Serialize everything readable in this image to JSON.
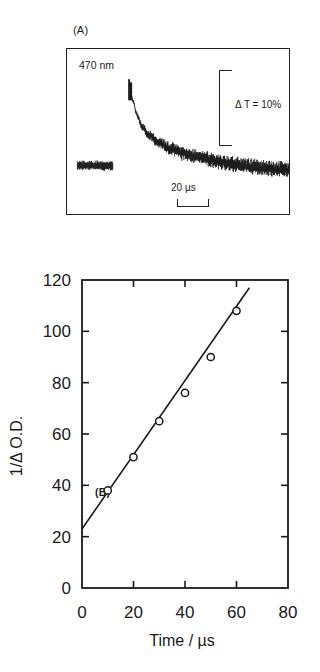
{
  "figure": {
    "panels": [
      {
        "tag": "(A)",
        "type": "oscilloscope-trace",
        "wavelength_label": "470 nm",
        "vertical_scale_label": "Δ T = 10%",
        "horizontal_scale_label": "20 µs"
      },
      {
        "tag": "(B)",
        "type": "scatter-with-fit"
      }
    ]
  },
  "chart_data": {
    "type": "scatter",
    "title": "",
    "xlabel": "Time  /   µs",
    "ylabel": "1/Δ O.D.",
    "xlim": [
      0,
      80
    ],
    "ylim": [
      0,
      120
    ],
    "xticks": [
      0,
      20,
      40,
      60,
      80
    ],
    "yticks": [
      0,
      20,
      40,
      60,
      80,
      100,
      120
    ],
    "xtick_labels": [
      "0",
      "20",
      "40",
      "60",
      "80"
    ],
    "ytick_labels": [
      "0",
      "20",
      "40",
      "60",
      "80",
      "100",
      "120"
    ],
    "grid": false,
    "legend": false,
    "marker": "open-circle",
    "series": [
      {
        "name": "1/Δ O.D. vs time",
        "x": [
          10,
          20,
          30,
          40,
          50,
          60
        ],
        "y": [
          38,
          51,
          65,
          76,
          90,
          108
        ]
      }
    ],
    "fit_line": {
      "name": "linear fit",
      "intercept": 23,
      "slope": 1.45,
      "x_start": 0,
      "x_end": 65,
      "y_start": 23,
      "y_end": 117
    }
  },
  "panel_a_trace": {
    "description": "flash-photolysis transient: pre-trigger baseline block, sharp rise, noisy decay",
    "baseline_segment": {
      "x_start": 10,
      "y_center": 118,
      "x_end": 46,
      "noise": 9
    },
    "rise": {
      "x": 63,
      "y_top": 30
    },
    "decay_points": [
      [
        63,
        36
      ],
      [
        66,
        52
      ],
      [
        70,
        66
      ],
      [
        75,
        78
      ],
      [
        82,
        87
      ],
      [
        92,
        95
      ],
      [
        104,
        101
      ],
      [
        118,
        106
      ],
      [
        134,
        110
      ],
      [
        152,
        114
      ],
      [
        170,
        117
      ],
      [
        188,
        119
      ],
      [
        204,
        121
      ],
      [
        218,
        122
      ],
      [
        224,
        123
      ]
    ]
  }
}
